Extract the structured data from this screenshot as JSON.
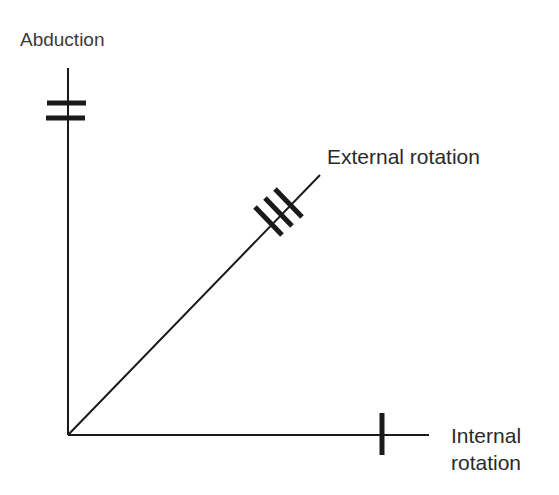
{
  "diagram": {
    "type": "three-axis movement diagram",
    "axes": [
      {
        "id": "abduction",
        "label": "Abduction",
        "direction": "vertical",
        "tick_count": 2
      },
      {
        "id": "external_rotation",
        "label": "External rotation",
        "direction": "diagonal",
        "tick_count": 3
      },
      {
        "id": "internal_rotation",
        "label_line1": "Internal",
        "label_line2": "rotation",
        "direction": "horizontal",
        "tick_count": 1
      }
    ],
    "colors": {
      "line": "#1a1a1a",
      "text": "#2a2a2a",
      "background": "#ffffff"
    }
  }
}
